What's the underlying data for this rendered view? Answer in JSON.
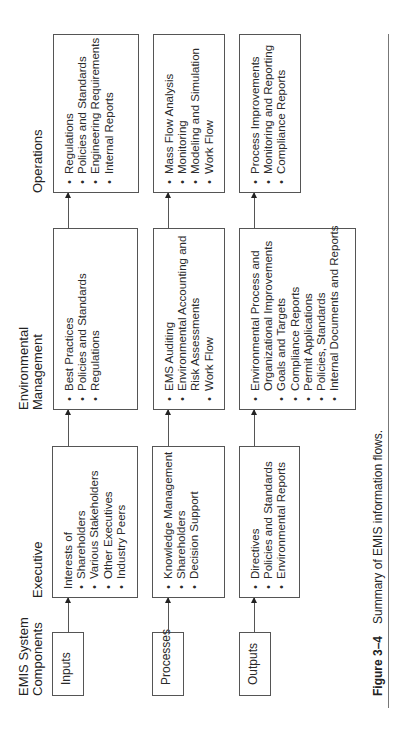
{
  "headers": {
    "components": [
      "EMIS System",
      "Components"
    ],
    "executive": "Executive",
    "environmental": [
      "Environmental",
      "Management"
    ],
    "operations": "Operations"
  },
  "rows": [
    {
      "component": "Inputs",
      "executive": {
        "intro": "Interests of",
        "items": [
          "Shareholders",
          "Various Stakeholders",
          "Other Executives",
          "Industry Peers"
        ]
      },
      "environmental": {
        "items": [
          "Best Practices",
          "Policies and Standards",
          "Regulations"
        ]
      },
      "operations": {
        "items": [
          "Regulations",
          "Policies and Standards",
          "Engineering Requirements",
          "Internal Reports"
        ]
      }
    },
    {
      "component": "Processes",
      "executive": {
        "items": [
          "Knowledge Management",
          "Shareholders",
          "Decision Support"
        ]
      },
      "environmental": {
        "items": [
          "EMS Auditing",
          "Environmental Accounting and",
          "Risk Assessments",
          "Work Flow"
        ]
      },
      "operations": {
        "items": [
          "Mass Flow Analysis",
          "Monitoring",
          "Modeling and Simulation",
          "Work Flow"
        ]
      }
    },
    {
      "component": "Outputs",
      "executive": {
        "items": [
          "Directives",
          "Policies and Standards",
          "Environmental Reports"
        ]
      },
      "environmental": {
        "items": [
          "Environmental Process and",
          "Organizational Improvements",
          "Goals and Targets",
          "Compliance Reports",
          "Permit Applications",
          "Policies, Standards",
          "Internal Documents and Reports"
        ]
      },
      "operations": {
        "items": [
          "Process Improvements",
          "Monitoring and Reporting",
          "Compliance Reports"
        ]
      }
    }
  ],
  "caption": {
    "figure": "Figure 3–4",
    "text": "Summary of EMIS information flows."
  },
  "colors": {
    "line": "#555555",
    "text": "#2a2a2a",
    "background": "#ffffff"
  }
}
